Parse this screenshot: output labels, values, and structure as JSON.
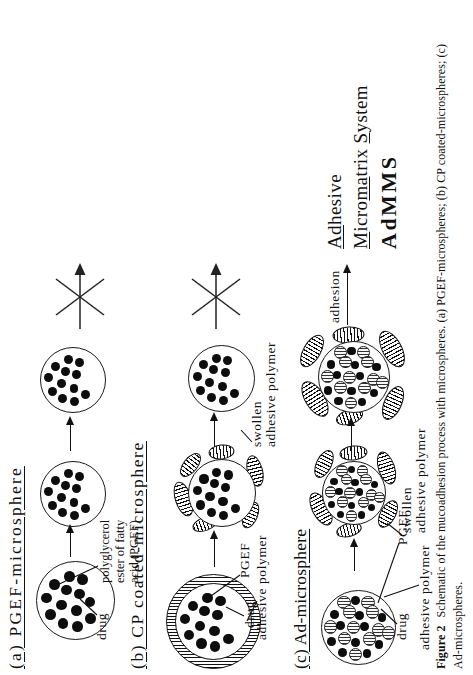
{
  "rows": {
    "a": {
      "heading": "(a) PGEF-microsphere",
      "label_drug": "drug",
      "label_pgef_1": "polyglycerol",
      "label_pgef_2": "ester of fatty",
      "label_pgef_3": "acid (PGEF)"
    },
    "b": {
      "heading": "(b) CP coated-microsphere",
      "label_drug": "drug",
      "label_pgef": "PGEF",
      "label_adhesive": "adhesive polymer",
      "label_swollen_1": "swollen",
      "label_swollen_2": "adhesive polymer"
    },
    "c": {
      "heading": "(c) Ad-microsphere",
      "label_drug": "drug",
      "label_adhesive": "adhesive polymer",
      "label_pgef": "PGEF",
      "label_swollen_1": "swollen",
      "label_swollen_2": "adhesive polymer"
    }
  },
  "adhesion": {
    "label": "adhesion"
  },
  "admms": {
    "l1a": "Ad",
    "l1b": "hesive",
    "l2a": "M",
    "l2b": "icro",
    "l2c": "ma",
    "l2d": "trix ",
    "l2e": "S",
    "l2f": "ystem",
    "l3": "AdMMS"
  },
  "caption": {
    "tag": "Figure 2",
    "line1": "Schematic of the mucoadhesion process with microspheres. (a) PGEF-microspheres; (b) CP coated-microspheres; (c)",
    "line2": "Ad-microspheres."
  },
  "colors": {
    "ink": "#111111",
    "paper": "#ffffff"
  }
}
